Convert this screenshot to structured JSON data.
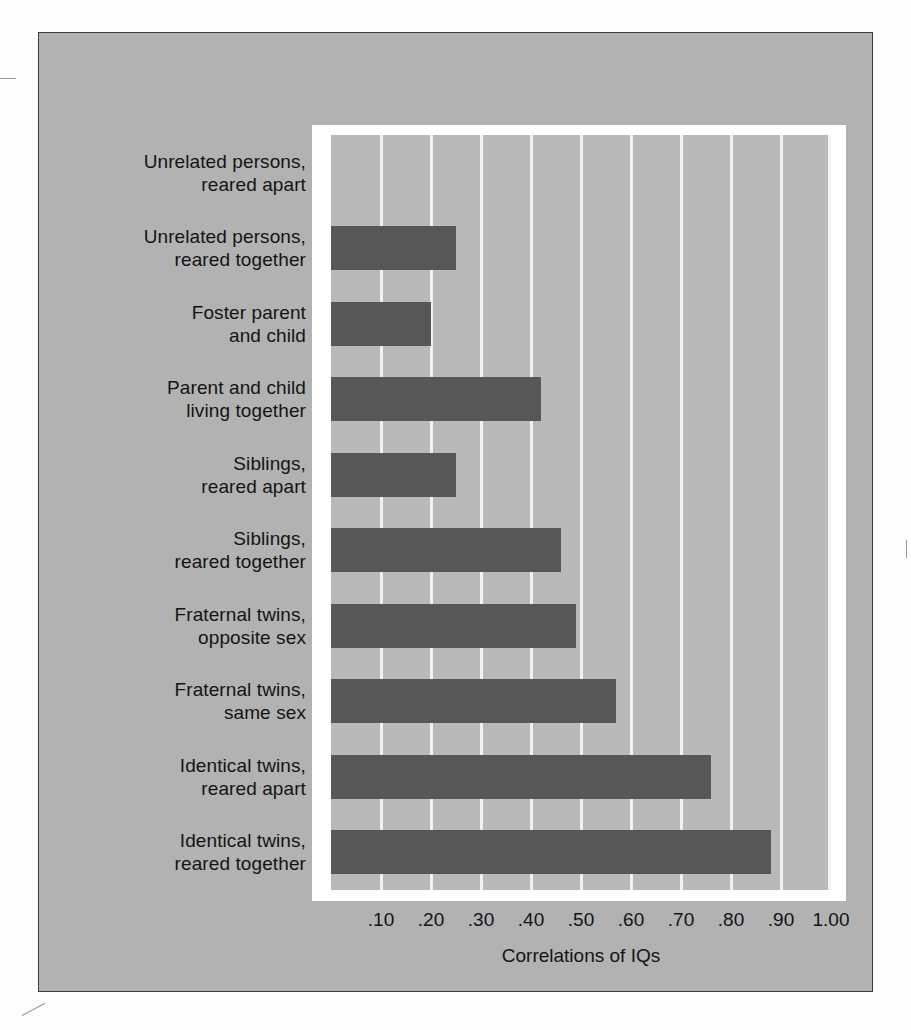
{
  "chart_data": {
    "type": "bar",
    "orientation": "horizontal",
    "title": "",
    "xlabel": "Correlations of IQs",
    "ylabel": "",
    "xlim": [
      0.0,
      1.0
    ],
    "grid": true,
    "legend": "none",
    "tick_labels": [
      ".10",
      ".20",
      ".30",
      ".40",
      ".50",
      ".60",
      ".70",
      ".80",
      ".90",
      "1.00"
    ],
    "tick_values": [
      0.1,
      0.2,
      0.3,
      0.4,
      0.5,
      0.6,
      0.7,
      0.8,
      0.9,
      1.0
    ],
    "categories": [
      "Unrelated persons, reared apart",
      "Unrelated persons, reared together",
      "Foster parent and child",
      "Parent and child living together",
      "Siblings, reared apart",
      "Siblings, reared together",
      "Fraternal twins, opposite sex",
      "Fraternal twins, same sex",
      "Identical twins, reared apart",
      "Identical twins, reared together"
    ],
    "values": [
      0.0,
      0.25,
      0.2,
      0.42,
      0.25,
      0.46,
      0.49,
      0.57,
      0.76,
      0.88
    ]
  },
  "colors": {
    "bar": "#575757",
    "plot_background": "#b9b9b9",
    "panel_background": "#b2b2b2",
    "gridline": "#f2f2f2",
    "frame": "#ffffff",
    "text": "#141414"
  },
  "labels": [
    {
      "line1": "Unrelated persons,",
      "line2": "reared apart"
    },
    {
      "line1": "Unrelated persons,",
      "line2": "reared together"
    },
    {
      "line1": "Foster parent",
      "line2": "and child"
    },
    {
      "line1": "Parent and child",
      "line2": "living together"
    },
    {
      "line1": "Siblings,",
      "line2": "reared apart"
    },
    {
      "line1": "Siblings,",
      "line2": "reared together"
    },
    {
      "line1": "Fraternal twins,",
      "line2": "opposite sex"
    },
    {
      "line1": "Fraternal twins,",
      "line2": "same sex"
    },
    {
      "line1": "Identical twins,",
      "line2": "reared apart"
    },
    {
      "line1": "Identical twins,",
      "line2": "reared together"
    }
  ],
  "axis": {
    "title": "Correlations of IQs"
  }
}
